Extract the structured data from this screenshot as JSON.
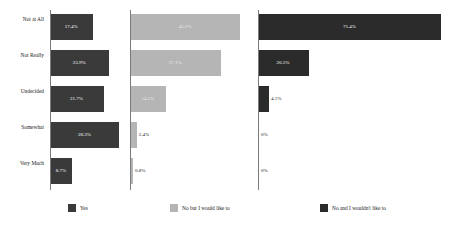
{
  "chart_data": {
    "type": "bar",
    "title": "",
    "subtitle": "",
    "xlabel": "",
    "ylabel": "",
    "orientation": "horizontal",
    "grid": false,
    "legend_position": "bottom",
    "panel_layout": "three side-by-side panels sharing category axis",
    "xlim": [
      0,
      80
    ],
    "categories": [
      "Not at All",
      "Not Really",
      "Undecided",
      "Somewhat",
      "Very Much"
    ],
    "series": [
      {
        "name": "Yes",
        "color": "#3a3a3a",
        "values": [
          17.4,
          23.9,
          21.7,
          28.3,
          8.7
        ],
        "labels": [
          "17.4%",
          "23.9%",
          "21.7%",
          "28.3%",
          "8.7%"
        ]
      },
      {
        "name": "No but I would like to",
        "color": "#b5b5b5",
        "values": [
          45.2,
          37.1,
          14.5,
          2.4,
          0.8
        ],
        "labels": [
          "45.2%",
          "37.1%",
          "14.5%",
          "2.4%",
          "0.8%"
        ]
      },
      {
        "name": "No and I wouldn't like to",
        "color": "#2b2b2b",
        "values": [
          75.4,
          20.5,
          4.1,
          0,
          0
        ],
        "labels": [
          "75.4%",
          "20.5%",
          "4.1%",
          "0%",
          "0%"
        ]
      }
    ]
  },
  "legend": {
    "items": [
      {
        "label": "Yes",
        "color": "#3a3a3a"
      },
      {
        "label": "No but I would like to",
        "color": "#b5b5b5"
      },
      {
        "label": "No and I wouldn't like to",
        "color": "#2b2b2b"
      }
    ]
  }
}
